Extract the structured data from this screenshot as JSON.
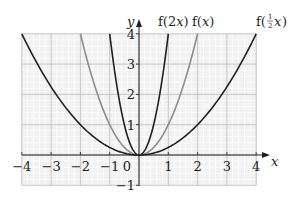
{
  "chart_data": {
    "type": "line",
    "title": "",
    "xlabel": "x",
    "ylabel": "y",
    "xlim": [
      -4,
      4
    ],
    "ylim": [
      -1,
      4
    ],
    "grid": true,
    "x_ticks": [
      -4,
      -3,
      -2,
      -1,
      0,
      1,
      2,
      3,
      4
    ],
    "x_tick_labels": [
      "−4",
      "−3",
      "−2",
      "−1",
      "0",
      "1",
      "2",
      "3",
      "4"
    ],
    "y_ticks": [
      -1,
      1,
      2,
      3,
      4
    ],
    "y_tick_labels": [
      "−1",
      "1",
      "2",
      "3",
      "4"
    ],
    "series": [
      {
        "name": "f(2x)",
        "label": "f(2x)",
        "formula": "4x^2",
        "color": "#231f20",
        "x": [
          -1,
          -0.75,
          -0.5,
          -0.25,
          0,
          0.25,
          0.5,
          0.75,
          1
        ],
        "y": [
          4,
          2.25,
          1,
          0.25,
          0,
          0.25,
          1,
          2.25,
          4
        ]
      },
      {
        "name": "f(x)",
        "label": "f(x)",
        "formula": "x^2",
        "color": "#8c8c8c",
        "x": [
          -2,
          -1.5,
          -1,
          -0.5,
          0,
          0.5,
          1,
          1.5,
          2
        ],
        "y": [
          4,
          2.25,
          1,
          0.25,
          0,
          0.25,
          1,
          2.25,
          4
        ]
      },
      {
        "name": "f(1/2 x)",
        "label": "f(½x)",
        "formula": "x^2/4",
        "color": "#231f20",
        "x": [
          -4,
          -3,
          -2,
          -1,
          0,
          1,
          2,
          3,
          4
        ],
        "y": [
          4,
          2.25,
          1,
          0.25,
          0,
          0.25,
          1,
          2.25,
          4
        ]
      }
    ]
  },
  "labels": {
    "y_axis": "y",
    "x_axis": "x",
    "f2x_prefix": "f(2",
    "f2x_var": "x",
    "f2x_suffix": ")",
    "fx_prefix": "f(",
    "fx_var": "x",
    "fx_suffix": ")",
    "fhalf_prefix": "f(",
    "fhalf_num": "1",
    "fhalf_den": "2",
    "fhalf_var": "x",
    "fhalf_suffix": ")"
  }
}
